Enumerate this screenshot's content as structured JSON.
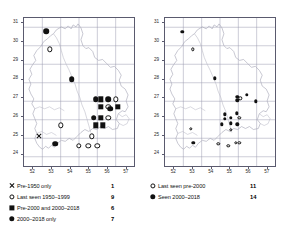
{
  "chart_data": {
    "type": "scatter",
    "title": "",
    "panels": [
      {
        "id": "left",
        "xlabel": "",
        "ylabel": "",
        "xlim": [
          51.5,
          57.5
        ],
        "ylim": [
          23.5,
          31.5
        ],
        "xticks": [
          "52",
          "53",
          "54",
          "55",
          "56",
          "57"
        ],
        "yticks": [
          "31",
          "30",
          "29",
          "28",
          "27",
          "26",
          "25",
          "24"
        ],
        "grid": true,
        "legend_position": "below",
        "legend": [
          {
            "symbol": "cross",
            "label": "Pre-1950 only",
            "count": "1"
          },
          {
            "symbol": "open",
            "label": "Last seen 1950–1999",
            "count": "9"
          },
          {
            "symbol": "square",
            "label": "Pre-2000 and 2000–2018",
            "count": "6"
          },
          {
            "symbol": "filled",
            "label": "2000–2018 only",
            "count": "7"
          }
        ],
        "points": [
          {
            "x": 52.7,
            "y": 30.8,
            "symbol": "filled"
          },
          {
            "x": 52.9,
            "y": 29.8,
            "symbol": "open"
          },
          {
            "x": 54.1,
            "y": 28.2,
            "symbol": "filled"
          },
          {
            "x": 55.4,
            "y": 27.1,
            "symbol": "filled"
          },
          {
            "x": 55.7,
            "y": 27.1,
            "symbol": "square"
          },
          {
            "x": 56.1,
            "y": 27.1,
            "symbol": "filled"
          },
          {
            "x": 56.5,
            "y": 27.1,
            "symbol": "open"
          },
          {
            "x": 55.7,
            "y": 26.7,
            "symbol": "square"
          },
          {
            "x": 56.1,
            "y": 26.7,
            "symbol": "open"
          },
          {
            "x": 56.2,
            "y": 26.6,
            "symbol": "filled"
          },
          {
            "x": 56.6,
            "y": 26.7,
            "symbol": "square"
          },
          {
            "x": 55.3,
            "y": 26.1,
            "symbol": "filled"
          },
          {
            "x": 55.7,
            "y": 26.1,
            "symbol": "square"
          },
          {
            "x": 56.1,
            "y": 26.1,
            "symbol": "open"
          },
          {
            "x": 55.4,
            "y": 25.7,
            "symbol": "square"
          },
          {
            "x": 55.8,
            "y": 25.7,
            "symbol": "square"
          },
          {
            "x": 53.5,
            "y": 25.7,
            "symbol": "open"
          },
          {
            "x": 52.3,
            "y": 25.1,
            "symbol": "cross"
          },
          {
            "x": 55.2,
            "y": 25.1,
            "symbol": "open"
          },
          {
            "x": 53.2,
            "y": 24.7,
            "symbol": "filled"
          },
          {
            "x": 54.5,
            "y": 24.6,
            "symbol": "open"
          },
          {
            "x": 55.0,
            "y": 24.6,
            "symbol": "open"
          },
          {
            "x": 55.5,
            "y": 24.6,
            "symbol": "open"
          }
        ]
      },
      {
        "id": "right",
        "xlabel": "",
        "ylabel": "",
        "xlim": [
          51.5,
          57.5
        ],
        "ylim": [
          23.5,
          31.5
        ],
        "xticks": [
          "52",
          "53",
          "54",
          "55",
          "56",
          "57"
        ],
        "yticks": [
          "31",
          "30",
          "29",
          "28",
          "27",
          "26",
          "25",
          "24"
        ],
        "grid": true,
        "legend_position": "below",
        "legend": [
          {
            "symbol": "open",
            "label": "Last seen pre-2000",
            "count": "11"
          },
          {
            "symbol": "filled",
            "label": "Seen 2000–2018",
            "count": "14"
          }
        ],
        "points": [
          {
            "x": 52.45,
            "y": 30.75,
            "symbol": "filled"
          },
          {
            "x": 53.0,
            "y": 29.8,
            "symbol": "open"
          },
          {
            "x": 54.2,
            "y": 28.25,
            "symbol": "filled"
          },
          {
            "x": 55.45,
            "y": 27.25,
            "symbol": "filled"
          },
          {
            "x": 55.45,
            "y": 27.05,
            "symbol": "filled"
          },
          {
            "x": 55.6,
            "y": 27.15,
            "symbol": "open"
          },
          {
            "x": 55.95,
            "y": 27.35,
            "symbol": "filled"
          },
          {
            "x": 56.45,
            "y": 27.0,
            "symbol": "filled"
          },
          {
            "x": 54.75,
            "y": 26.3,
            "symbol": "filled"
          },
          {
            "x": 55.4,
            "y": 26.35,
            "symbol": "filled"
          },
          {
            "x": 54.75,
            "y": 26.05,
            "symbol": "filled"
          },
          {
            "x": 55.1,
            "y": 26.1,
            "symbol": "filled"
          },
          {
            "x": 55.55,
            "y": 26.1,
            "symbol": "open"
          },
          {
            "x": 54.6,
            "y": 25.75,
            "symbol": "filled"
          },
          {
            "x": 55.1,
            "y": 25.8,
            "symbol": "filled"
          },
          {
            "x": 55.45,
            "y": 25.75,
            "symbol": "filled"
          },
          {
            "x": 55.1,
            "y": 25.45,
            "symbol": "open"
          },
          {
            "x": 52.9,
            "y": 25.5,
            "symbol": "open"
          },
          {
            "x": 53.05,
            "y": 24.75,
            "symbol": "filled"
          },
          {
            "x": 54.4,
            "y": 24.7,
            "symbol": "open"
          },
          {
            "x": 55.35,
            "y": 24.75,
            "symbol": "open"
          },
          {
            "x": 55.55,
            "y": 24.75,
            "symbol": "open"
          },
          {
            "x": 54.95,
            "y": 24.6,
            "symbol": "open"
          }
        ]
      }
    ]
  }
}
